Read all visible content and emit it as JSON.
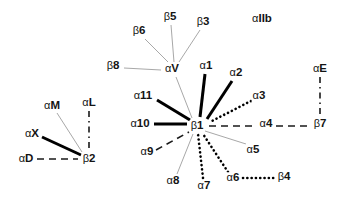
{
  "diagram": {
    "type": "node-link-graph",
    "width": 345,
    "height": 199,
    "background_color": "#ffffff",
    "text_color": "#141414",
    "line_colors": {
      "strong": "#000000",
      "weak": "#a8a8a8",
      "dashed": "#1a1a1a",
      "dotted": "#000000"
    },
    "nodes": [
      {
        "id": "aM",
        "label": "αM",
        "greek": "α",
        "body": "M",
        "x": 52,
        "y": 106,
        "kind": "alpha"
      },
      {
        "id": "aL",
        "label": "αL",
        "greek": "α",
        "body": "L",
        "x": 89,
        "y": 103,
        "kind": "alpha"
      },
      {
        "id": "aX",
        "label": "αX",
        "greek": "α",
        "body": "X",
        "x": 32,
        "y": 134,
        "kind": "alpha"
      },
      {
        "id": "aD",
        "label": "αD",
        "greek": "α",
        "body": "D",
        "x": 26,
        "y": 159,
        "kind": "alpha"
      },
      {
        "id": "b2",
        "label": "β2",
        "greek": "β",
        "body": "2",
        "x": 89,
        "y": 159,
        "kind": "beta"
      },
      {
        "id": "b6",
        "label": "β6",
        "greek": "β",
        "body": "6",
        "x": 139,
        "y": 31,
        "kind": "beta"
      },
      {
        "id": "b5",
        "label": "β5",
        "greek": "β",
        "body": "5",
        "x": 170,
        "y": 17,
        "kind": "beta"
      },
      {
        "id": "b3",
        "label": "β3",
        "greek": "β",
        "body": "3",
        "x": 203,
        "y": 22,
        "kind": "beta"
      },
      {
        "id": "b8",
        "label": "β8",
        "greek": "β",
        "body": "8",
        "x": 113,
        "y": 66,
        "kind": "beta"
      },
      {
        "id": "aV",
        "label": "αV",
        "greek": "α",
        "body": "V",
        "x": 172,
        "y": 69,
        "kind": "alpha"
      },
      {
        "id": "aIIb",
        "label": "αIIb",
        "greek": "α",
        "body": "IIb",
        "x": 262,
        "y": 19,
        "kind": "alpha"
      },
      {
        "id": "a1",
        "label": "α1",
        "greek": "α",
        "body": "1",
        "x": 206,
        "y": 66,
        "kind": "alpha"
      },
      {
        "id": "a2",
        "label": "α2",
        "greek": "α",
        "body": "2",
        "x": 236,
        "y": 73,
        "kind": "alpha"
      },
      {
        "id": "aE",
        "label": "αE",
        "greek": "α",
        "body": "E",
        "x": 320,
        "y": 69,
        "kind": "alpha"
      },
      {
        "id": "a11",
        "label": "α11",
        "greek": "α",
        "body": "11",
        "x": 143,
        "y": 96,
        "kind": "alpha"
      },
      {
        "id": "a3",
        "label": "α3",
        "greek": "α",
        "body": "3",
        "x": 259,
        "y": 96,
        "kind": "alpha"
      },
      {
        "id": "a10",
        "label": "α10",
        "greek": "α",
        "body": "10",
        "x": 140,
        "y": 124,
        "kind": "alpha"
      },
      {
        "id": "b1",
        "label": "β1",
        "greek": "β",
        "body": "1",
        "x": 197,
        "y": 126,
        "kind": "beta"
      },
      {
        "id": "a4",
        "label": "α4",
        "greek": "α",
        "body": "4",
        "x": 266,
        "y": 124,
        "kind": "alpha"
      },
      {
        "id": "b7",
        "label": "β7",
        "greek": "β",
        "body": "7",
        "x": 320,
        "y": 124,
        "kind": "beta"
      },
      {
        "id": "a9",
        "label": "α9",
        "greek": "α",
        "body": "9",
        "x": 147,
        "y": 152,
        "kind": "alpha"
      },
      {
        "id": "a5",
        "label": "α5",
        "greek": "α",
        "body": "5",
        "x": 253,
        "y": 150,
        "kind": "alpha"
      },
      {
        "id": "a8",
        "label": "α8",
        "greek": "α",
        "body": "8",
        "x": 173,
        "y": 181,
        "kind": "alpha"
      },
      {
        "id": "a7",
        "label": "α7",
        "greek": "α",
        "body": "7",
        "x": 204,
        "y": 186,
        "kind": "alpha"
      },
      {
        "id": "a6",
        "label": "α6",
        "greek": "α",
        "body": "6",
        "x": 233,
        "y": 178,
        "kind": "alpha"
      },
      {
        "id": "b4",
        "label": "β4",
        "greek": "β",
        "body": "4",
        "x": 284,
        "y": 177,
        "kind": "beta"
      }
    ],
    "edges": [
      {
        "from": "aM",
        "to": "b2",
        "style": "thin",
        "x1": 57,
        "y1": 113,
        "x2": 82,
        "y2": 152
      },
      {
        "from": "aL",
        "to": "b2",
        "style": "dashdot",
        "x1": 89,
        "y1": 111,
        "x2": 89,
        "y2": 151
      },
      {
        "from": "aX",
        "to": "b2",
        "style": "thick",
        "x1": 42,
        "y1": 137,
        "x2": 81,
        "y2": 155
      },
      {
        "from": "aD",
        "to": "b2",
        "style": "dashed",
        "x1": 37,
        "y1": 159,
        "x2": 78,
        "y2": 159
      },
      {
        "from": "b8",
        "to": "aV",
        "style": "thin",
        "x1": 124,
        "y1": 68,
        "x2": 161,
        "y2": 70
      },
      {
        "from": "b6",
        "to": "aV",
        "style": "thin",
        "x1": 145,
        "y1": 39,
        "x2": 168,
        "y2": 62
      },
      {
        "from": "b5",
        "to": "aV",
        "style": "thin",
        "x1": 171,
        "y1": 25,
        "x2": 174,
        "y2": 62
      },
      {
        "from": "b3",
        "to": "aV",
        "style": "thin",
        "x1": 200,
        "y1": 30,
        "x2": 179,
        "y2": 62
      },
      {
        "from": "aV",
        "to": "b1",
        "style": "thin",
        "x1": 176,
        "y1": 77,
        "x2": 192,
        "y2": 118
      },
      {
        "from": "a1",
        "to": "b1",
        "style": "thick",
        "x1": 205,
        "y1": 74,
        "x2": 200,
        "y2": 117
      },
      {
        "from": "a2",
        "to": "b1",
        "style": "thick",
        "x1": 232,
        "y1": 81,
        "x2": 207,
        "y2": 119
      },
      {
        "from": "a3",
        "to": "b1",
        "style": "dotted",
        "x1": 251,
        "y1": 101,
        "x2": 210,
        "y2": 122
      },
      {
        "from": "a11",
        "to": "b1",
        "style": "thick",
        "x1": 157,
        "y1": 100,
        "x2": 190,
        "y2": 120
      },
      {
        "from": "a10",
        "to": "b1",
        "style": "thick",
        "x1": 154,
        "y1": 124,
        "x2": 187,
        "y2": 124
      },
      {
        "from": "b1",
        "to": "a4",
        "style": "dashed",
        "x1": 209,
        "y1": 126,
        "x2": 257,
        "y2": 126
      },
      {
        "from": "a4",
        "to": "b7",
        "style": "dashed",
        "x1": 276,
        "y1": 126,
        "x2": 311,
        "y2": 126
      },
      {
        "from": "aE",
        "to": "b7",
        "style": "dashdot",
        "x1": 320,
        "y1": 77,
        "x2": 320,
        "y2": 117
      },
      {
        "from": "a9",
        "to": "b1",
        "style": "dashed",
        "x1": 156,
        "y1": 150,
        "x2": 189,
        "y2": 132
      },
      {
        "from": "a8",
        "to": "b1",
        "style": "thin",
        "x1": 177,
        "y1": 174,
        "x2": 193,
        "y2": 134
      },
      {
        "from": "a7",
        "to": "b1",
        "style": "dotted",
        "x1": 203,
        "y1": 178,
        "x2": 198,
        "y2": 134
      },
      {
        "from": "a6",
        "to": "b1",
        "style": "dotted",
        "x1": 228,
        "y1": 172,
        "x2": 203,
        "y2": 134
      },
      {
        "from": "a5",
        "to": "b1",
        "style": "thin",
        "x1": 246,
        "y1": 144,
        "x2": 205,
        "y2": 131
      },
      {
        "from": "a6",
        "to": "b4",
        "style": "dotted",
        "x1": 243,
        "y1": 178,
        "x2": 275,
        "y2": 178
      }
    ]
  }
}
